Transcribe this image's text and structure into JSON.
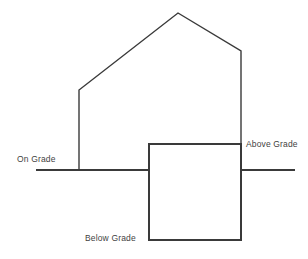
{
  "diagram": {
    "background_color": "#ffffff",
    "stroke_color": "#3a3a3a",
    "text_color": "#3f3f3f",
    "stroke_width": 1.4,
    "labels": {
      "on_grade": "On Grade",
      "above_grade": "Above Grade",
      "below_grade": "Below Grade"
    },
    "shapes": {
      "house_outline": {
        "name": "house-outline",
        "points": "79,170 79,90 178,13 241,51 241,240"
      },
      "grade_line_left": {
        "name": "grade-line-left",
        "x1": 36,
        "y1": 170,
        "x2": 149,
        "y2": 170
      },
      "grade_line_right": {
        "name": "grade-line-right",
        "x1": 241,
        "y1": 170,
        "x2": 295,
        "y2": 170
      },
      "basement_rect": {
        "name": "basement-rectangle",
        "x": 149,
        "y": 144,
        "width": 92,
        "height": 96
      }
    }
  }
}
